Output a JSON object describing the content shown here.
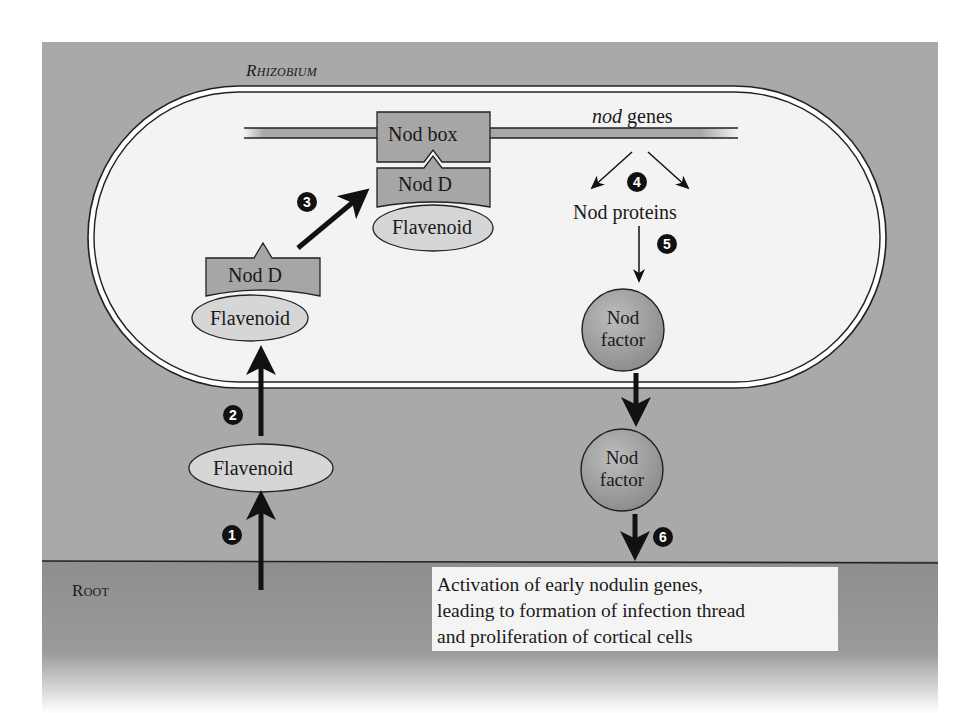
{
  "figure": {
    "labels": {
      "rhizobium": "Rhizobium",
      "root": "Root",
      "nod_box": "Nod box",
      "nod_genes_italic": "nod",
      "nod_genes_rest": " genes",
      "nod_d_upper": "Nod D",
      "flavenoid_upper": "Flavenoid",
      "nod_d_left": "Nod D",
      "flavenoid_left": "Flavenoid",
      "flavenoid_outside": "Flavenoid",
      "nod_proteins": "Nod proteins",
      "nod_factor_inside_line1": "Nod",
      "nod_factor_inside_line2": "factor",
      "nod_factor_outside_line1": "Nod",
      "nod_factor_outside_line2": "factor"
    },
    "steps": [
      "1",
      "2",
      "3",
      "4",
      "5",
      "6"
    ],
    "outcome": {
      "lines": [
        "Activation of early nodulin genes,",
        "leading to formation of infection thread",
        "and proliferation of cortical cells"
      ]
    },
    "colors": {
      "soil": "#a9a9a9",
      "root": "#8f8f8f",
      "cell_interior": "#f3f3f3",
      "protein_box": "#a6a6a6",
      "flavenoid": "#d6d6d6",
      "nod_factor": "#9a9a9a",
      "badge": "#111111"
    }
  }
}
